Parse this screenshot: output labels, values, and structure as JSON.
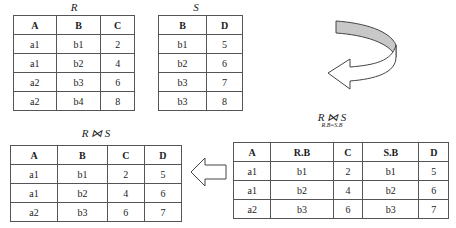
{
  "relation_r": {
    "title": "R",
    "columns": [
      "A",
      "B",
      "C"
    ],
    "rows": [
      [
        "a1",
        "b1",
        "2"
      ],
      [
        "a1",
        "b2",
        "4"
      ],
      [
        "a2",
        "b3",
        "6"
      ],
      [
        "a2",
        "b4",
        "8"
      ]
    ]
  },
  "relation_s": {
    "title": "S",
    "columns": [
      "B",
      "D"
    ],
    "rows": [
      [
        "b1",
        "5"
      ],
      [
        "b2",
        "6"
      ],
      [
        "b3",
        "7"
      ],
      [
        "b3",
        "8"
      ]
    ]
  },
  "join_label": {
    "title": "R ⋈ S",
    "condition": "R.B=S.B"
  },
  "join_table": {
    "columns": [
      "A",
      "R.B",
      "C",
      "S.B",
      "D"
    ],
    "rows": [
      [
        "a1",
        "b1",
        "2",
        "b1",
        "5"
      ],
      [
        "a1",
        "b2",
        "4",
        "b2",
        "6"
      ],
      [
        "a2",
        "b3",
        "6",
        "b3",
        "7"
      ]
    ]
  },
  "natural_join": {
    "title": "R ⋈ S",
    "columns": [
      "A",
      "B",
      "C",
      "D"
    ],
    "rows": [
      [
        "a1",
        "b1",
        "2",
        "5"
      ],
      [
        "a1",
        "b2",
        "4",
        "6"
      ],
      [
        "a2",
        "b3",
        "6",
        "7"
      ]
    ]
  },
  "colors": {
    "arrow_fill": "#c8c8c8",
    "border": "#555555"
  }
}
